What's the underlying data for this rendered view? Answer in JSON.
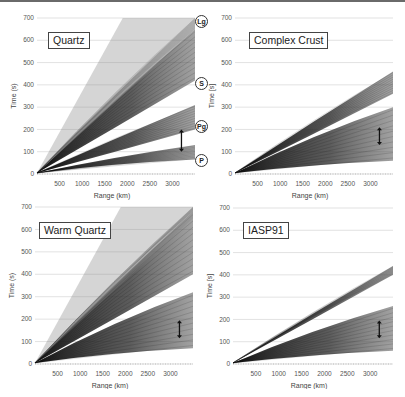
{
  "figure": {
    "panels": [
      {
        "id": "quartz",
        "title": "Quartz",
        "ylabel": "Time (s)",
        "xlabel": "Range (km)"
      },
      {
        "id": "complex-crust",
        "title": "Complex Crust",
        "ylabel": "Time [s]",
        "xlabel": "Range (km)"
      },
      {
        "id": "warm-quartz",
        "title": "Warm Quartz",
        "ylabel": "Time (s)",
        "xlabel": "Range (km)"
      },
      {
        "id": "iasp91",
        "title": "IASP91",
        "ylabel": "Time [s]",
        "xlabel": "Range (km)"
      }
    ],
    "phase_labels": [
      "Lg",
      "S",
      "Pg",
      "P"
    ],
    "yticks": [
      "0",
      "100",
      "200",
      "300",
      "400",
      "500",
      "600",
      "700"
    ],
    "xticks": [
      "500",
      "1000",
      "1500",
      "2000",
      "2500",
      "3000"
    ]
  },
  "chart_data": [
    {
      "type": "heatmap",
      "title": "Quartz",
      "xlabel": "Range (km)",
      "ylabel": "Time (s)",
      "xlim": [
        0,
        3500
      ],
      "ylim": [
        0,
        700
      ],
      "xticks": [
        500,
        1000,
        1500,
        2000,
        2500,
        3000
      ],
      "yticks": [
        0,
        100,
        200,
        300,
        400,
        500,
        600,
        700
      ],
      "grid": "horizontal",
      "annotations": [
        {
          "label": "Lg",
          "time_s": 700
        },
        {
          "label": "S",
          "time_s": 420
        },
        {
          "label": "Pg",
          "time_s": 205
        },
        {
          "label": "P",
          "time_s": 60
        },
        {
          "type": "double-arrow",
          "range_km": 3200,
          "time_s": [
            100,
            200
          ]
        }
      ],
      "bands": [
        {
          "phase": "P",
          "time_at_3500km_s": [
            65,
            130
          ]
        },
        {
          "phase": "Pg",
          "time_at_3500km_s": [
            200,
            310
          ]
        },
        {
          "phase": "S",
          "time_at_3500km_s": [
            420,
            650
          ]
        },
        {
          "phase": "Lg",
          "time_at_3500km_s": [
            650,
            700
          ]
        }
      ]
    },
    {
      "type": "heatmap",
      "title": "Complex Crust",
      "xlabel": "Range (km)",
      "ylabel": "Time [s]",
      "xlim": [
        0,
        3500
      ],
      "ylim": [
        0,
        700
      ],
      "xticks": [
        500,
        1000,
        1500,
        2000,
        2500,
        3000
      ],
      "yticks": [
        0,
        100,
        200,
        300,
        400,
        500,
        600,
        700
      ],
      "grid": "horizontal",
      "annotations": [
        {
          "type": "double-arrow",
          "range_km": 3200,
          "time_s": [
            130,
            210
          ]
        }
      ],
      "bands": [
        {
          "phase": "P",
          "time_at_3500km_s": [
            60,
            300
          ]
        },
        {
          "phase": "S",
          "time_at_3500km_s": [
            360,
            460
          ]
        }
      ]
    },
    {
      "type": "heatmap",
      "title": "Warm Quartz",
      "xlabel": "Range (km)",
      "ylabel": "Time (s)",
      "xlim": [
        0,
        3500
      ],
      "ylim": [
        0,
        700
      ],
      "xticks": [
        500,
        1000,
        1500,
        2000,
        2500,
        3000
      ],
      "yticks": [
        0,
        100,
        200,
        300,
        400,
        500,
        600,
        700
      ],
      "grid": "horizontal",
      "annotations": [
        {
          "type": "double-arrow",
          "range_km": 3200,
          "time_s": [
            115,
            195
          ]
        }
      ],
      "bands": [
        {
          "phase": "P",
          "time_at_3500km_s": [
            70,
            320
          ]
        },
        {
          "phase": "S",
          "time_at_3500km_s": [
            400,
            680
          ]
        },
        {
          "phase": "Lg",
          "time_at_3500km_s": [
            680,
            700
          ]
        }
      ]
    },
    {
      "type": "heatmap",
      "title": "IASP91",
      "xlabel": "Range (km)",
      "ylabel": "Time [s]",
      "xlim": [
        0,
        3500
      ],
      "ylim": [
        0,
        700
      ],
      "xticks": [
        500,
        1000,
        1500,
        2000,
        2500,
        3000
      ],
      "yticks": [
        0,
        100,
        200,
        300,
        400,
        500,
        600,
        700
      ],
      "grid": "horizontal",
      "annotations": [
        {
          "type": "double-arrow",
          "range_km": 3200,
          "time_s": [
            115,
            195
          ]
        }
      ],
      "bands": [
        {
          "phase": "P",
          "time_at_3500km_s": [
            60,
            260
          ]
        },
        {
          "phase": "S",
          "time_at_3500km_s": [
            400,
            440
          ]
        }
      ]
    }
  ]
}
